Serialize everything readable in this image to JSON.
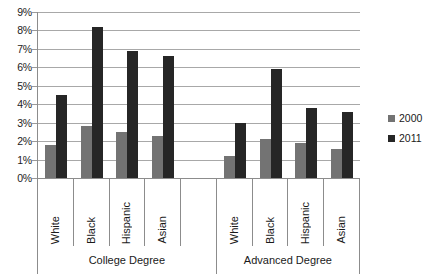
{
  "chart_data": {
    "type": "bar",
    "title": "",
    "xlabel": "",
    "ylabel": "",
    "ylim": [
      0,
      9
    ],
    "y_tick_labels": [
      "0%",
      "1%",
      "2%",
      "3%",
      "4%",
      "5%",
      "6%",
      "7%",
      "8%",
      "9%"
    ],
    "y_tick_values": [
      0,
      1,
      2,
      3,
      4,
      5,
      6,
      7,
      8,
      9
    ],
    "grid": true,
    "legend_position": "right",
    "categories": [
      "White",
      "Black",
      "Hispanic",
      "Asian",
      "",
      "White",
      "Black",
      "Hispanic",
      "Asian"
    ],
    "groups": [
      {
        "label": "College Degree",
        "span": 5
      },
      {
        "label": "Advanced Degree",
        "span": 4
      }
    ],
    "series": [
      {
        "name": "2000",
        "color": "#737373",
        "values": [
          1.8,
          2.8,
          2.5,
          2.3,
          null,
          1.2,
          2.1,
          1.9,
          1.6
        ]
      },
      {
        "name": "2011",
        "color": "#262626",
        "values": [
          4.5,
          8.2,
          6.9,
          6.6,
          null,
          3.0,
          5.9,
          3.8,
          3.6
        ]
      }
    ]
  },
  "legend": {
    "items": [
      {
        "label": "2000",
        "color": "#737373"
      },
      {
        "label": "2011",
        "color": "#262626"
      }
    ]
  }
}
